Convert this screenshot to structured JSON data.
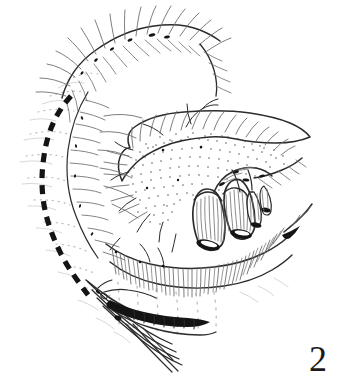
{
  "figure": {
    "number_label": "2",
    "style": "pen-and-ink stipple line drawing",
    "background_color": "#ffffff",
    "ink_color": "#2b2b2b",
    "solid_black_color": "#141414",
    "light_ink_color": "#b9b9b9",
    "width_px": 342,
    "height_px": 386
  },
  "elements": {
    "incision_dashed_line": {
      "name": "dashed incision line",
      "color": "#141414",
      "style": "thick dashed arc",
      "dash_pattern": "9 7",
      "stroke_width": 5
    },
    "stippled_mass": {
      "name": "stippled organ mass",
      "texture": "dot stipple",
      "fringe": "hatched upper border"
    },
    "cut_tubes": {
      "name": "cut tubular vessels",
      "count": 2,
      "lumen_fill": "#141414"
    },
    "lower_fringe_band": {
      "name": "lower hatched fringe band",
      "hatch_direction": "downward"
    },
    "upper_fringe_band": {
      "name": "upper hatched fringe band",
      "hatch_direction": "outward"
    },
    "instrument": {
      "name": "surgical instrument shaft",
      "tip": "dark elongated clamped band"
    }
  }
}
